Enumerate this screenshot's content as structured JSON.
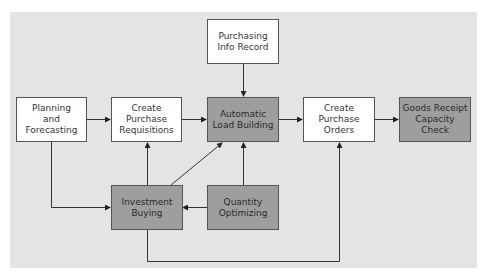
{
  "diagram": {
    "colors": {
      "background_panel": "#e4e4e4",
      "light_box": "#ffffff",
      "dark_box": "#9e9e9e",
      "line": "#333333"
    },
    "nodes": {
      "purchasing_info_record": {
        "label": "Purchasing\nInfo Record",
        "style": "light"
      },
      "planning_forecasting": {
        "label": "Planning\nand\nForecasting",
        "style": "light"
      },
      "create_purchase_requisitions": {
        "label": "Create\nPurchase\nRequisitions",
        "style": "light"
      },
      "automatic_load_building": {
        "label": "Automatic\nLoad Building",
        "style": "dark"
      },
      "create_purchase_orders": {
        "label": "Create\nPurchase\nOrders",
        "style": "light"
      },
      "goods_receipt_capacity_check": {
        "label": "Goods Receipt\nCapacity Check",
        "style": "dark"
      },
      "investment_buying": {
        "label": "Investment\nBuying",
        "style": "dark"
      },
      "quantity_optimizing": {
        "label": "Quantity\nOptimizing",
        "style": "dark"
      }
    },
    "edges": [
      {
        "from": "Planning and Forecasting",
        "to": "Create Purchase Requisitions"
      },
      {
        "from": "Create Purchase Requisitions",
        "to": "Automatic Load Building"
      },
      {
        "from": "Purchasing Info Record",
        "to": "Automatic Load Building"
      },
      {
        "from": "Automatic Load Building",
        "to": "Create Purchase Orders"
      },
      {
        "from": "Create Purchase Orders",
        "to": "Goods Receipt Capacity Check"
      },
      {
        "from": "Planning and Forecasting",
        "to": "Investment Buying"
      },
      {
        "from": "Investment Buying",
        "to": "Create Purchase Requisitions"
      },
      {
        "from": "Investment Buying",
        "to": "Automatic Load Building"
      },
      {
        "from": "Quantity Optimizing",
        "to": "Automatic Load Building"
      },
      {
        "from": "Quantity Optimizing",
        "to": "Investment Buying"
      },
      {
        "from": "Investment Buying",
        "to": "Create Purchase Orders"
      }
    ]
  }
}
